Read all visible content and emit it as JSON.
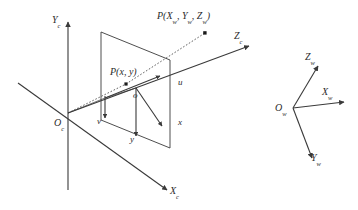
{
  "figure": {
    "name": "camera-projection-coordinate-systems-diagram",
    "stroke_color": "#3a3a3a",
    "label_color": "#2b2b2b",
    "background": "#ffffff",
    "width": 358,
    "height": 210
  },
  "camera_frame": {
    "origin_label": "O",
    "origin_sub": "c",
    "x_axis_label": "X",
    "x_axis_sub": "c",
    "y_axis_label": "Y",
    "y_axis_sub": "c",
    "z_axis_label": "Z",
    "z_axis_sub": "c"
  },
  "image_plane": {
    "pixel_origin_label": "",
    "u_axis_label": "u",
    "v_axis_label": "v",
    "image_origin_label": "o",
    "x_axis_label": "x",
    "y_axis_label": "y",
    "projected_point_label": "P(x, y)",
    "projected_point_name": "P",
    "projected_point_args": "(x, y)"
  },
  "world_point": {
    "label_prefix": "P(",
    "x_sym": "X",
    "y_sym": "Y",
    "z_sym": "Z",
    "sub": "w",
    "label_suffix": ")",
    "full_label": "P(Xw, Yw, Zw)"
  },
  "world_frame": {
    "origin_label": "O",
    "origin_sub": "w",
    "x_axis_label": "X",
    "x_axis_sub": "w",
    "y_axis_label": "Y",
    "y_axis_sub": "w",
    "z_axis_label": "Z",
    "z_axis_sub": "w"
  }
}
